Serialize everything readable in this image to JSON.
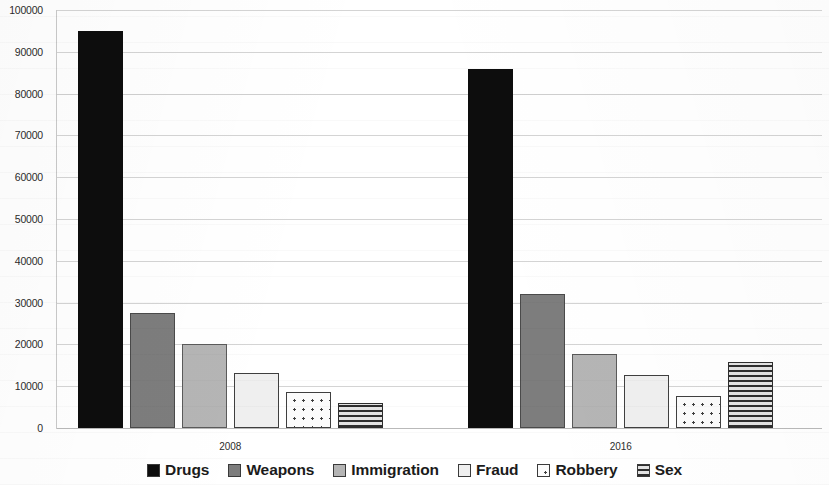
{
  "chart_data": {
    "type": "bar",
    "title": "",
    "subtitle": "",
    "xlabel": "",
    "ylabel": "",
    "categories": [
      "2008",
      "2016"
    ],
    "ylim": [
      0,
      100000
    ],
    "ytick_step": 10000,
    "yticks": [
      "100000",
      "90000",
      "80000",
      "70000",
      "60000",
      "50000",
      "40000",
      "30000",
      "20000",
      "10000",
      "0"
    ],
    "grid": true,
    "legend_position": "bottom",
    "series": [
      {
        "name": "Drugs",
        "values": [
          95000,
          86000
        ],
        "color": "#0d0d0d",
        "pattern": "solid"
      },
      {
        "name": "Weapons",
        "values": [
          27500,
          32000
        ],
        "color": "#7d7d7d",
        "pattern": "solid"
      },
      {
        "name": "Immigration",
        "values": [
          20200,
          17800
        ],
        "color": "#b5b5b5",
        "pattern": "solid"
      },
      {
        "name": "Fraud",
        "values": [
          13100,
          12800
        ],
        "color": "#efefef",
        "pattern": "outline"
      },
      {
        "name": "Robbery",
        "values": [
          8500,
          7600
        ],
        "color": "#fbfbfb",
        "pattern": "dots"
      },
      {
        "name": "Sex",
        "values": [
          6000,
          15800
        ],
        "color": "#e9e9e9",
        "pattern": "horizontal-lines"
      }
    ]
  }
}
